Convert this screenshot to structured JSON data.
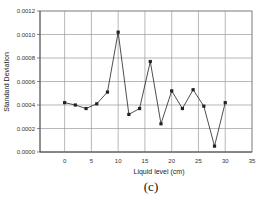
{
  "chart_data": {
    "type": "line",
    "title": "",
    "caption": "(c)",
    "xlabel": "Liquid level (cm)",
    "ylabel": "Standard Deviation",
    "xlim": [
      -4.6,
      35
    ],
    "ylim": [
      0,
      0.0012
    ],
    "x_ticks": [
      0,
      5,
      10,
      15,
      20,
      25,
      30,
      35
    ],
    "y_ticks": [
      "0.0000",
      "0.0002",
      "0.0004",
      "0.0006",
      "0.0008",
      "0.0010",
      "0.0012"
    ],
    "grid": true,
    "legend": null,
    "series": [
      {
        "name": "Standard Deviation",
        "color": "#222222",
        "marker": "square",
        "x": [
          0,
          2,
          4,
          6,
          8,
          10,
          12,
          14,
          16,
          18,
          20,
          22,
          24,
          26,
          28,
          30
        ],
        "values": [
          0.00042,
          0.0004,
          0.00037,
          0.00041,
          0.00051,
          0.00102,
          0.00032,
          0.00037,
          0.00077,
          0.00024,
          0.00052,
          0.00037,
          0.00053,
          0.00039,
          5e-05,
          0.00042
        ]
      }
    ]
  }
}
